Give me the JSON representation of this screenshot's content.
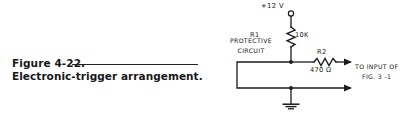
{
  "figure": {
    "caption_number": "Figure 4-22.",
    "caption_text": "Electronic-trigger arrangement."
  },
  "schematic": {
    "supply_label": "+12 V",
    "r1_designator": "R1",
    "r1_value": "10K",
    "r2_designator": "R2",
    "r2_value": "470 Ω",
    "protective_line_1": "PROTECTIVE",
    "protective_line_2": "CIRCUIT",
    "output_line_1": "TO INPUT OF",
    "output_line_2": "FIG. 3 -1",
    "ink_color": "#1b1b20",
    "paper_color": "#ffffff"
  }
}
